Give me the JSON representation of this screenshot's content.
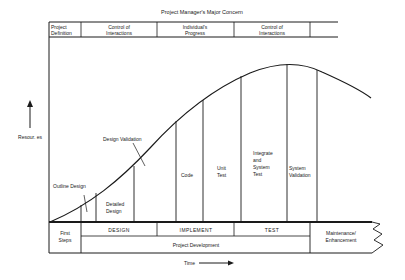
{
  "title": "Project Manager's Major Concern",
  "top_table": [
    {
      "label_lines": [
        "Project",
        "Definition"
      ]
    },
    {
      "label_lines": [
        "Control of",
        "Interactions"
      ]
    },
    {
      "label_lines": [
        "Individual's",
        "Progress"
      ]
    },
    {
      "label_lines": [
        "Control of",
        "Interactions"
      ]
    },
    {
      "label_lines": []
    }
  ],
  "y_axis_label": "Resour. es",
  "x_axis_label": "Time",
  "activities": {
    "outline_design": "Outline Design",
    "detailed_design": [
      "Detailed",
      "Design"
    ],
    "design_validation": "Design Validation",
    "code": "Code",
    "unit_test": [
      "Unit",
      "Test"
    ],
    "integrate": [
      "Integrate",
      "and",
      "System",
      "Test"
    ],
    "system_validation": [
      "System",
      "Validation"
    ]
  },
  "bottom_table": {
    "first_steps": [
      "First",
      "Steps"
    ],
    "phases": [
      "DESIGN",
      "IMPLEMENT",
      "TEST"
    ],
    "project_development": "Project Development",
    "maintenance": [
      "Maintenance/",
      "Enhancement"
    ]
  },
  "colors": {
    "ink": "#1a1a1a",
    "background": "#ffffff"
  }
}
